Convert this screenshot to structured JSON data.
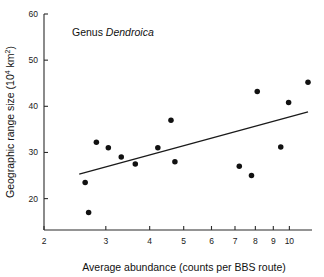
{
  "chart_data": {
    "type": "scatter",
    "title": "",
    "annotation": {
      "prefix": "Genus ",
      "italic": "Dendroica"
    },
    "xlabel": "Average abundance (counts per BBS route)",
    "ylabel": "Geographic range size (10⁴ km²)",
    "ylabel_parts": {
      "main": "Geographic range size (10",
      "sup": "4",
      "mid": " km",
      "sup2": "2",
      "tail": ")"
    },
    "xscale": "log",
    "yscale": "linear",
    "xlim": [
      2,
      11.6
    ],
    "ylim": [
      13.2,
      60
    ],
    "xticks": [
      2,
      3,
      4,
      5,
      6,
      7,
      8,
      9,
      10
    ],
    "xtick_labels": [
      "2",
      "3",
      "4",
      "5",
      "6",
      "7",
      "8",
      "9",
      "10"
    ],
    "yticks": [
      20,
      30,
      40,
      50,
      60
    ],
    "ytick_labels": [
      "20",
      "30",
      "40",
      "50",
      "60"
    ],
    "grid": false,
    "legend": null,
    "marker": {
      "shape": "circle",
      "color": "#111111",
      "size": 4.0
    },
    "points": [
      {
        "x": 2.62,
        "y": 23.5
      },
      {
        "x": 2.68,
        "y": 17.0
      },
      {
        "x": 2.82,
        "y": 32.2
      },
      {
        "x": 3.05,
        "y": 31.0
      },
      {
        "x": 3.32,
        "y": 29.0
      },
      {
        "x": 3.64,
        "y": 27.5
      },
      {
        "x": 4.22,
        "y": 31.0
      },
      {
        "x": 4.6,
        "y": 37.0
      },
      {
        "x": 4.72,
        "y": 28.0
      },
      {
        "x": 7.2,
        "y": 27.0
      },
      {
        "x": 7.8,
        "y": 25.0
      },
      {
        "x": 8.1,
        "y": 43.2
      },
      {
        "x": 9.45,
        "y": 31.2
      },
      {
        "x": 9.95,
        "y": 40.8
      },
      {
        "x": 11.3,
        "y": 45.2
      }
    ],
    "fit_line": {
      "type": "linear-on-log-x",
      "x_start": 2.52,
      "y_start": 25.3,
      "x_end": 11.3,
      "y_end": 38.8,
      "color": "#1a1a1a"
    }
  }
}
